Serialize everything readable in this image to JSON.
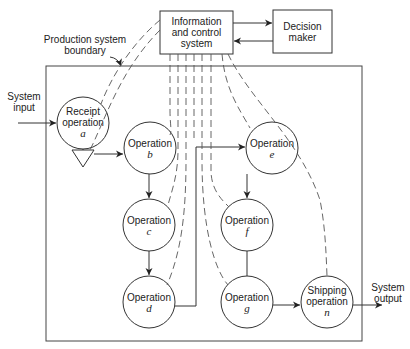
{
  "diagram": {
    "nodes": {
      "info_system": {
        "label": "Information and control system",
        "lines": [
          "Information",
          "and control",
          "system"
        ]
      },
      "decision_maker": {
        "lines": [
          "Decision",
          "maker"
        ]
      },
      "boundary_label": {
        "lines": [
          "Production system",
          "boundary"
        ]
      },
      "system_input": {
        "lines": [
          "System",
          "input"
        ]
      },
      "system_output": {
        "lines": [
          "System",
          "output"
        ]
      },
      "receipt": {
        "lines": [
          "Receipt",
          "operation"
        ],
        "id": "a"
      },
      "op_b": {
        "lines": [
          "Operation"
        ],
        "id": "b"
      },
      "op_c": {
        "lines": [
          "Operation"
        ],
        "id": "c"
      },
      "op_d": {
        "lines": [
          "Operation"
        ],
        "id": "d"
      },
      "op_e": {
        "lines": [
          "Operation"
        ],
        "id": "e"
      },
      "op_f": {
        "lines": [
          "Operation"
        ],
        "id": "f"
      },
      "op_g": {
        "lines": [
          "Operation"
        ],
        "id": "g"
      },
      "shipping": {
        "lines": [
          "Shipping",
          "operation"
        ],
        "id": "n"
      }
    },
    "edges": [
      {
        "from": "system_input",
        "to": "receipt",
        "style": "solid"
      },
      {
        "from": "receipt",
        "to": "inventory",
        "style": "solid"
      },
      {
        "from": "inventory",
        "to": "op_b",
        "style": "solid"
      },
      {
        "from": "op_b",
        "to": "op_c",
        "style": "solid"
      },
      {
        "from": "op_c",
        "to": "op_d",
        "style": "solid"
      },
      {
        "from": "op_d",
        "to": "op_e",
        "style": "solid"
      },
      {
        "from": "op_e",
        "to": "op_f",
        "style": "solid"
      },
      {
        "from": "op_f",
        "to": "op_g",
        "style": "solid"
      },
      {
        "from": "op_g",
        "to": "shipping",
        "style": "solid"
      },
      {
        "from": "shipping",
        "to": "system_output",
        "style": "solid"
      },
      {
        "from": "info_system",
        "to": "decision_maker",
        "style": "solid"
      },
      {
        "from": "decision_maker",
        "to": "info_system",
        "style": "solid"
      },
      {
        "from": "info_system",
        "to": "each operation",
        "style": "dashed"
      }
    ]
  }
}
